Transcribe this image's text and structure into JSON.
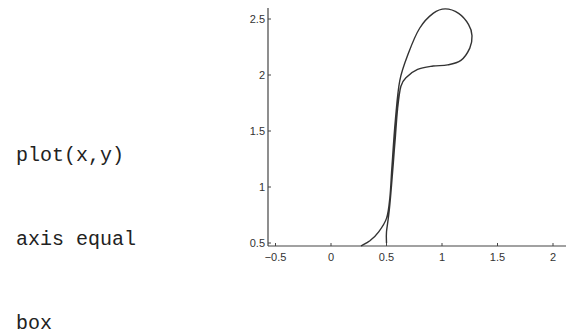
{
  "code_lines": [
    "plot(x,y)",
    "axis equal",
    "box"
  ],
  "chart_data": {
    "type": "line",
    "title": "",
    "xlabel": "",
    "ylabel": "",
    "xlim": [
      -0.5,
      2.05
    ],
    "ylim": [
      0.5,
      2.6
    ],
    "grid": false,
    "legend": null,
    "xticks": [
      "-0.5",
      "0",
      "0.5",
      "1",
      "1.5",
      "2"
    ],
    "xtick_values": [
      -0.5,
      0,
      0.5,
      1,
      1.5,
      2
    ],
    "yticks": [
      "0.5",
      "1",
      "1.5",
      "2",
      "2.5"
    ],
    "ytick_values": [
      0.5,
      1,
      1.5,
      2,
      2.5
    ],
    "series": [
      {
        "name": "curve",
        "x": [
          0.27,
          0.35,
          0.43,
          0.5,
          0.53,
          0.55,
          0.58,
          0.62,
          0.7,
          0.8,
          0.92,
          1.03,
          1.15,
          1.24,
          1.27,
          1.25,
          1.17,
          1.05,
          0.92,
          0.78,
          0.68,
          0.63,
          0.6,
          0.58,
          0.56,
          0.54,
          0.52,
          0.5,
          0.5
        ],
        "y": [
          0.47,
          0.52,
          0.6,
          0.72,
          0.9,
          1.2,
          1.6,
          1.95,
          2.2,
          2.42,
          2.55,
          2.59,
          2.55,
          2.45,
          2.35,
          2.24,
          2.13,
          2.09,
          2.08,
          2.05,
          1.98,
          1.9,
          1.7,
          1.45,
          1.2,
          0.95,
          0.75,
          0.6,
          0.5
        ]
      }
    ]
  }
}
